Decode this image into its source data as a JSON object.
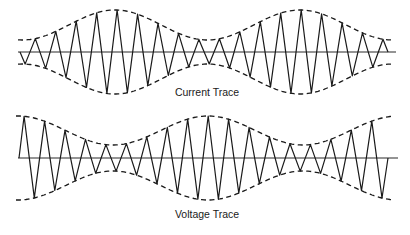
{
  "diagram": {
    "title": "",
    "colors": {
      "line": "#1a1a1a",
      "background": "#ffffff"
    },
    "traces": [
      {
        "id": "current",
        "label": "Current Trace",
        "label_pos": [
          207,
          96
        ],
        "axis": {
          "y": 52,
          "x_start": 18,
          "x_end": 396
        },
        "wave": {
          "x_start": 20,
          "x_end": 388,
          "period": 20.45,
          "phase": "minus-sine"
        },
        "envelope": {
          "x_start": 18,
          "x_end": 392,
          "description": "amplitude small at ends and at centre (~x=205), maximal near x=115 and x=300",
          "min_amp": 12,
          "max_amp": 42,
          "shape": "cos",
          "max_at": [
            115,
            300
          ]
        }
      },
      {
        "id": "voltage",
        "label": "Voltage Trace",
        "label_pos": [
          207,
          218
        ],
        "axis": {
          "y": 158,
          "x_start": 18,
          "x_end": 398
        },
        "wave": {
          "x_start": 19,
          "x_end": 388,
          "period": 20.45,
          "phase": "sine"
        },
        "envelope": {
          "x_start": 16,
          "x_end": 392,
          "description": "amplitude maximal at ends and centre (~x=208), minimal near x=110 and x=305",
          "min_amp": 13,
          "max_amp": 42,
          "shape": "cos",
          "max_at": [
            20,
            208,
            392
          ]
        }
      }
    ]
  }
}
